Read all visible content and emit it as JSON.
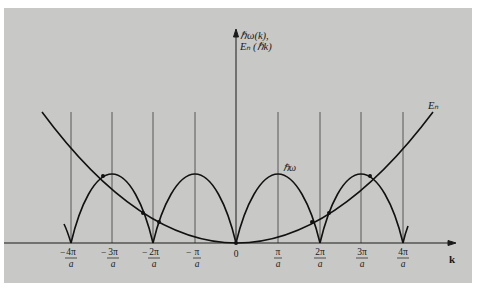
{
  "figure": {
    "y_axis_label_line1": "ℏω(k),",
    "y_axis_label_line2": "Eₙ (ℏk)",
    "x_axis_label": "k",
    "curve_labels": {
      "phonon": "ℏω",
      "electron": "Eₙ"
    },
    "ticks": [
      {
        "sign": "−",
        "num": "4π",
        "den": "a",
        "value": -4
      },
      {
        "sign": "−",
        "num": "3π",
        "den": "a",
        "value": -3
      },
      {
        "sign": "−",
        "num": "2π",
        "den": "a",
        "value": -2
      },
      {
        "sign": "−",
        "num": "π",
        "den": "a",
        "value": -1
      },
      {
        "sign": "",
        "num": "0",
        "den": "",
        "value": 0
      },
      {
        "sign": "",
        "num": "π",
        "den": "a",
        "value": 1
      },
      {
        "sign": "",
        "num": "2π",
        "den": "a",
        "value": 2
      },
      {
        "sign": "",
        "num": "3π",
        "den": "a",
        "value": 3
      },
      {
        "sign": "",
        "num": "4π",
        "den": "a",
        "value": 4
      }
    ],
    "colors": {
      "panel": "#c8c8c6",
      "ink": "#1a1a1a",
      "gridline": "#3a3a3a"
    }
  }
}
